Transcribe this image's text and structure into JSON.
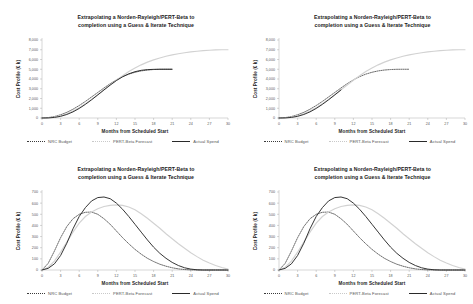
{
  "page": {
    "background": "#ffffff",
    "layout": "2x2 grid of charts"
  },
  "common": {
    "title_line1": "Extrapolating a Norden-Rayleigh/PERT-Beta to",
    "title_line2": "completion using a Guess & Iterate Technique",
    "xlabel": "Months from Scheduled Start",
    "ylabel_cumulative": "Cost Profile (€ k)",
    "ylabel_incremental": "Cost Profile (€ k)",
    "legend": [
      {
        "label": "NRC Budget",
        "style": "dotted",
        "color": "#3a3a3a"
      },
      {
        "label": "PERT-Beta Forecast",
        "style": "solid-light",
        "color": "#d2d2d2"
      },
      {
        "label": "Actual Spend",
        "style": "solid",
        "color": "#2a2a2a"
      }
    ],
    "xticks": [
      0,
      3,
      6,
      9,
      12,
      15,
      18,
      21,
      24,
      27,
      30
    ],
    "yticks_cumulative": [
      "0",
      "1,000",
      "2,000",
      "3,000",
      "4,000",
      "5,000",
      "6,000",
      "7,000",
      "8,000"
    ],
    "yticks_incremental": [
      "0",
      "100",
      "200",
      "300",
      "400",
      "500",
      "600",
      "700"
    ]
  },
  "chart_data": [
    {
      "id": "top-left",
      "type": "line",
      "title": "Extrapolating a Norden-Rayleigh/PERT-Beta to completion using a Guess & Iterate Technique",
      "xlabel": "Months from Scheduled Start",
      "ylabel": "Cost Profile (€ k)",
      "xlim": [
        0,
        30
      ],
      "ylim": [
        0,
        8000
      ],
      "grid": false,
      "legend_position": "below",
      "x": [
        0,
        1,
        2,
        3,
        4,
        5,
        6,
        7,
        8,
        9,
        10,
        11,
        12,
        13,
        14,
        15,
        16,
        17,
        18,
        19,
        20,
        21,
        22,
        23,
        24,
        25,
        26,
        27,
        28,
        29,
        30
      ],
      "series": [
        {
          "name": "NRC Budget",
          "style": "dotted",
          "values": [
            0,
            40,
            150,
            330,
            580,
            900,
            1280,
            1700,
            2160,
            2620,
            3080,
            3520,
            3910,
            4240,
            4500,
            4690,
            4830,
            4920,
            4970,
            4995,
            5000,
            5000,
            null,
            null,
            null,
            null,
            null,
            null,
            null,
            null,
            null
          ]
        },
        {
          "name": "PERT-Beta Forecast",
          "style": "solid-light",
          "values": [
            0,
            20,
            90,
            230,
            440,
            720,
            1060,
            1460,
            1910,
            2390,
            2890,
            3390,
            3880,
            4340,
            4760,
            5130,
            5450,
            5730,
            5960,
            6160,
            6330,
            6470,
            6590,
            6690,
            6780,
            6850,
            6910,
            6950,
            6980,
            6995,
            7000
          ]
        },
        {
          "name": "Actual Spend",
          "style": "solid",
          "values": [
            0,
            10,
            60,
            170,
            360,
            630,
            980,
            1400,
            1870,
            2370,
            2880,
            3380,
            3840,
            4230,
            4530,
            4750,
            4890,
            4960,
            4990,
            5000,
            5000,
            5000,
            null,
            null,
            null,
            null,
            null,
            null,
            null,
            null,
            null
          ]
        }
      ]
    },
    {
      "id": "top-right",
      "type": "line",
      "title": "Extrapolating a Norden-Rayleigh/PERT-Beta to completion using a Guess & Iterate Technique",
      "xlabel": "Months from Scheduled Start",
      "ylabel": "Cost Profile (€ k)",
      "xlim": [
        0,
        30
      ],
      "ylim": [
        0,
        8000
      ],
      "grid": false,
      "legend_position": "below",
      "x": [
        0,
        1,
        2,
        3,
        4,
        5,
        6,
        7,
        8,
        9,
        10,
        11,
        12,
        13,
        14,
        15,
        16,
        17,
        18,
        19,
        20,
        21,
        22,
        23,
        24,
        25,
        26,
        27,
        28,
        29,
        30
      ],
      "series": [
        {
          "name": "NRC Budget",
          "style": "dotted",
          "values": [
            0,
            40,
            150,
            330,
            580,
            900,
            1280,
            1700,
            2160,
            2620,
            3080,
            3520,
            3910,
            4240,
            4500,
            4690,
            4830,
            4920,
            4970,
            4995,
            5000,
            5000,
            null,
            null,
            null,
            null,
            null,
            null,
            null,
            null,
            null
          ]
        },
        {
          "name": "PERT-Beta Forecast",
          "style": "solid-light",
          "values": [
            0,
            20,
            90,
            230,
            440,
            720,
            1060,
            1460,
            1910,
            2390,
            2890,
            3390,
            3880,
            4340,
            4760,
            5130,
            5450,
            5730,
            5960,
            6160,
            6330,
            6470,
            6590,
            6690,
            6780,
            6850,
            6910,
            6950,
            6980,
            6995,
            7000
          ]
        },
        {
          "name": "Actual Spend",
          "style": "solid",
          "values": [
            0,
            10,
            60,
            170,
            360,
            630,
            980,
            1400,
            1870,
            2370,
            2880,
            null,
            null,
            null,
            null,
            null,
            null,
            null,
            null,
            null,
            null,
            null,
            null,
            null,
            null,
            null,
            null,
            null,
            null,
            null,
            null
          ],
          "note": "truncated at month 10 (actuals-to-date)"
        }
      ]
    },
    {
      "id": "bottom-left",
      "type": "line",
      "title": "Extrapolating a Norden-Rayleigh/PERT-Beta to completion using a Guess & Iterate Technique",
      "xlabel": "Months from Scheduled Start",
      "ylabel": "Cost Profile (€ k)",
      "xlim": [
        0,
        30
      ],
      "ylim": [
        0,
        700
      ],
      "grid": false,
      "legend_position": "below",
      "x": [
        0,
        1,
        2,
        3,
        4,
        5,
        6,
        7,
        8,
        9,
        10,
        11,
        12,
        13,
        14,
        15,
        16,
        17,
        18,
        19,
        20,
        21,
        22,
        23,
        24,
        25,
        26,
        27,
        28,
        29,
        30
      ],
      "series": [
        {
          "name": "NRC Budget",
          "style": "dotted",
          "values": [
            0,
            60,
            170,
            290,
            390,
            460,
            500,
            518,
            520,
            500,
            460,
            410,
            350,
            290,
            235,
            185,
            142,
            105,
            76,
            52,
            34,
            20,
            10,
            4,
            1,
            0,
            0,
            0,
            0,
            0,
            0
          ]
        },
        {
          "name": "PERT-Beta Forecast",
          "style": "solid-light",
          "values": [
            0,
            25,
            80,
            160,
            250,
            340,
            420,
            480,
            520,
            550,
            570,
            580,
            585,
            580,
            565,
            540,
            505,
            465,
            420,
            375,
            325,
            280,
            235,
            195,
            155,
            120,
            88,
            62,
            40,
            22,
            8
          ]
        },
        {
          "name": "Actual Spend",
          "style": "solid",
          "values": [
            0,
            15,
            55,
            130,
            240,
            370,
            480,
            560,
            620,
            650,
            655,
            640,
            600,
            545,
            480,
            410,
            340,
            270,
            205,
            150,
            105,
            68,
            40,
            20,
            8,
            2,
            0,
            0,
            0,
            0,
            0
          ]
        }
      ]
    },
    {
      "id": "bottom-right",
      "type": "line",
      "title": "Extrapolating a Norden-Rayleigh/PERT-Beta to completion using a Guess & Iterate Technique",
      "xlabel": "Months from Scheduled Start",
      "ylabel": "Cost Profile (€ k)",
      "xlim": [
        0,
        30
      ],
      "ylim": [
        0,
        700
      ],
      "grid": false,
      "legend_position": "below",
      "x": [
        0,
        1,
        2,
        3,
        4,
        5,
        6,
        7,
        8,
        9,
        10,
        11,
        12,
        13,
        14,
        15,
        16,
        17,
        18,
        19,
        20,
        21,
        22,
        23,
        24,
        25,
        26,
        27,
        28,
        29,
        30
      ],
      "series": [
        {
          "name": "NRC Budget",
          "style": "dotted",
          "values": [
            0,
            60,
            170,
            290,
            390,
            460,
            500,
            518,
            520,
            500,
            460,
            410,
            350,
            290,
            235,
            185,
            142,
            105,
            76,
            52,
            34,
            20,
            10,
            4,
            1,
            0,
            0,
            0,
            0,
            0,
            0
          ]
        },
        {
          "name": "PERT-Beta Forecast",
          "style": "solid-light",
          "values": [
            0,
            25,
            80,
            160,
            250,
            340,
            420,
            480,
            520,
            550,
            570,
            580,
            585,
            580,
            565,
            540,
            505,
            465,
            420,
            375,
            325,
            280,
            235,
            195,
            155,
            120,
            88,
            62,
            40,
            22,
            8
          ]
        },
        {
          "name": "Actual Spend",
          "style": "solid",
          "values": [
            0,
            15,
            55,
            130,
            240,
            370,
            480,
            560,
            620,
            650,
            655,
            640,
            600,
            545,
            480,
            410,
            340,
            270,
            205,
            150,
            105,
            68,
            40,
            20,
            8,
            2,
            0,
            0,
            0,
            0,
            0
          ]
        }
      ]
    }
  ]
}
